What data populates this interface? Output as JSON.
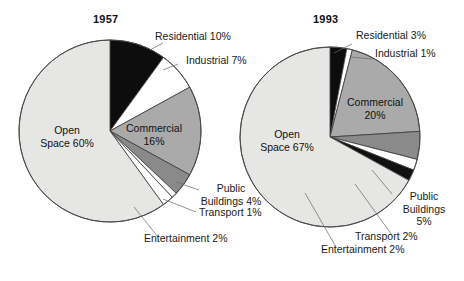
{
  "figure": {
    "background": "#ffffff",
    "charts": [
      {
        "id": "chart-1957",
        "title": "1957",
        "cx": 110,
        "cy": 131,
        "r": 91,
        "slices": [
          {
            "name": "Residential",
            "value": 10,
            "label": "Residential 10%",
            "color": "#0d0d0d"
          },
          {
            "name": "Industrial",
            "value": 7,
            "label": "Industrial 7%",
            "color": "#ffffff"
          },
          {
            "name": "Commercial",
            "value": 16,
            "label": "Commercial 16%",
            "color": "#aaaaaa"
          },
          {
            "name": "Public Buildings",
            "value": 4,
            "label": "Public Buildings 4%",
            "color": "#8a8a8a"
          },
          {
            "name": "Transport",
            "value": 1,
            "label": "Transport 1%",
            "color": "#ffffff"
          },
          {
            "name": "Entertainment",
            "value": 2,
            "label": "Entertainment 2%",
            "color": "#ffffff"
          },
          {
            "name": "Open Space",
            "value": 60,
            "label": "Open Space 60%",
            "color": "#e6e6e4"
          }
        ]
      },
      {
        "id": "chart-1993",
        "title": "1993",
        "cx": 330,
        "cy": 137,
        "r": 90,
        "slices": [
          {
            "name": "Residential",
            "value": 3,
            "label": "Residential 3%",
            "color": "#0d0d0d"
          },
          {
            "name": "Industrial",
            "value": 1,
            "label": "Industrial 1%",
            "color": "#ffffff"
          },
          {
            "name": "Commercial",
            "value": 20,
            "label": "Commercial 20%",
            "color": "#aaaaaa"
          },
          {
            "name": "Public Buildings",
            "value": 5,
            "label": "Public Buildings 5%",
            "color": "#8a8a8a"
          },
          {
            "name": "Transport",
            "value": 2,
            "label": "Transport 2%",
            "color": "#ffffff"
          },
          {
            "name": "Entertainment",
            "value": 2,
            "label": "Entertainment 2%",
            "color": "#111111"
          },
          {
            "name": "Open Space",
            "value": 67,
            "label": "Open Space 67%",
            "color": "#e6e6e4"
          }
        ]
      }
    ]
  },
  "chart_data": {
    "type": "pie",
    "title": "",
    "charts": [
      {
        "title": "1957",
        "categories": [
          "Residential",
          "Industrial",
          "Commercial",
          "Public Buildings",
          "Transport",
          "Entertainment",
          "Open Space"
        ],
        "values": [
          10,
          7,
          16,
          4,
          1,
          2,
          60
        ],
        "unit": "%",
        "labels": [
          "Residential 10%",
          "Industrial 7%",
          "Commercial 16%",
          "Public Buildings 4%",
          "Transport 1%",
          "Entertainment 2%",
          "Open Space 60%"
        ],
        "colors": [
          "#0d0d0d",
          "#ffffff",
          "#aaaaaa",
          "#8a8a8a",
          "#ffffff",
          "#ffffff",
          "#e6e6e4"
        ],
        "start_angle_deg": 0,
        "direction": "clockwise",
        "legend": "none (direct labels with leader lines)"
      },
      {
        "title": "1993",
        "categories": [
          "Residential",
          "Industrial",
          "Commercial",
          "Public Buildings",
          "Transport",
          "Entertainment",
          "Open Space"
        ],
        "values": [
          3,
          1,
          20,
          5,
          2,
          2,
          67
        ],
        "unit": "%",
        "labels": [
          "Residential 3%",
          "Industrial 1%",
          "Commercial 20%",
          "Public Buildings 5%",
          "Transport 2%",
          "Entertainment 2%",
          "Open Space 67%"
        ],
        "colors": [
          "#0d0d0d",
          "#ffffff",
          "#aaaaaa",
          "#8a8a8a",
          "#ffffff",
          "#111111",
          "#e6e6e4"
        ],
        "start_angle_deg": 0,
        "direction": "clockwise",
        "legend": "none (direct labels with leader lines)"
      }
    ]
  },
  "labels": {
    "c1_title": "1957",
    "c1_residential": "Residential 10%",
    "c1_industrial": "Industrial 7%",
    "c1_commercial_l1": "Commercial",
    "c1_commercial_l2": "16%",
    "c1_open_l1": "Open",
    "c1_open_l2": "Space 60%",
    "c1_public_l1": "Public",
    "c1_public_l2": "Buildings 4%",
    "c1_transport": "Transport 1%",
    "c1_entertainment": "Entertainment 2%",
    "c2_title": "1993",
    "c2_residential": "Residential 3%",
    "c2_industrial": "Industrial 1%",
    "c2_commercial_l1": "Commercial",
    "c2_commercial_l2": "20%",
    "c2_open_l1": "Open",
    "c2_open_l2": "Space 67%",
    "c2_public_l1": "Public",
    "c2_public_l2": "Buildings",
    "c2_public_l3": "5%",
    "c2_transport": "Transport 2%",
    "c2_entertainment": "Entertainment 2%"
  }
}
